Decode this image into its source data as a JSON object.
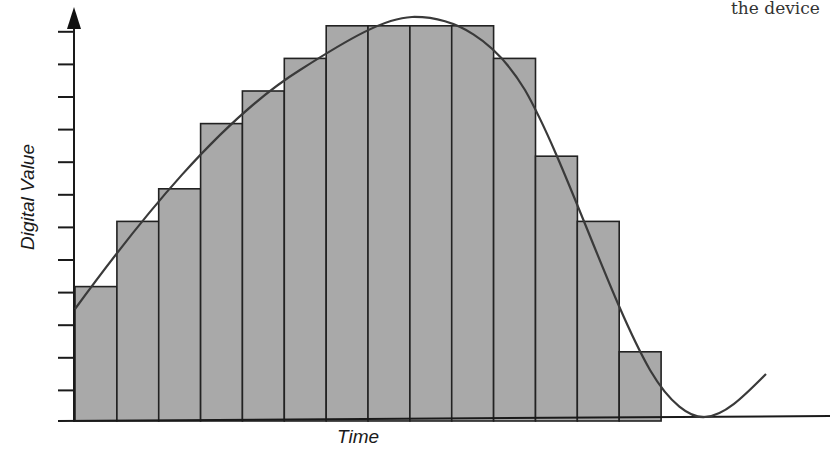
{
  "caption_fragment": "the device",
  "chart_data": {
    "type": "bar",
    "title": "",
    "xlabel": "Time",
    "ylabel": "Digital Value",
    "grid": false,
    "legend": null,
    "y_ticks": 12,
    "ylim": [
      0,
      12
    ],
    "categories": [
      "1",
      "2",
      "3",
      "4",
      "5",
      "6",
      "7",
      "8",
      "9",
      "10",
      "11",
      "12",
      "13",
      "14"
    ],
    "values": [
      4,
      6,
      7,
      9,
      10,
      11,
      12,
      12,
      12,
      12,
      11,
      8,
      6,
      2
    ],
    "series": [
      {
        "name": "Digital samples",
        "type": "bar",
        "values": [
          4,
          6,
          7,
          9,
          10,
          11,
          12,
          12,
          12,
          12,
          11,
          8,
          6,
          2
        ]
      },
      {
        "name": "Analog signal",
        "type": "line",
        "description": "Smooth curve rising from ~3.5 to peak ~12.4 near sample 9, falling to 0 after sample 15, then rising again"
      }
    ],
    "colors": {
      "bar_fill": "#a9a9a9",
      "bar_stroke": "#222222",
      "curve": "#3a3a3a",
      "axis": "#1a1a1a"
    }
  }
}
